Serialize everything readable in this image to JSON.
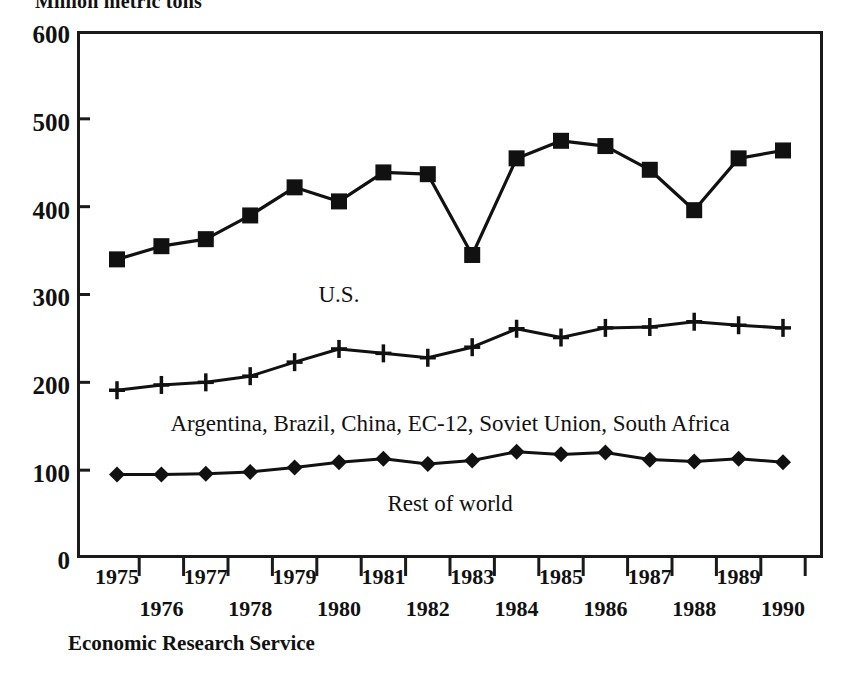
{
  "chart_data": {
    "type": "line",
    "title": "Million metric tons",
    "ylabel": "Million metric tons",
    "xlabel": "",
    "ylim": [
      0,
      600
    ],
    "yticks": [
      0,
      100,
      200,
      300,
      400,
      500,
      600
    ],
    "grid": false,
    "legend_position": "inline-annotations",
    "categories": [
      1975,
      1976,
      1977,
      1978,
      1979,
      1980,
      1981,
      1982,
      1983,
      1984,
      1985,
      1986,
      1987,
      1988,
      1989,
      1990
    ],
    "xtick_labels": [
      "1975",
      "1976",
      "1977",
      "1978",
      "1979",
      "1980",
      "1981",
      "1982",
      "1983",
      "1984",
      "1985",
      "1986",
      "1987",
      "1988",
      "1989",
      "1990"
    ],
    "series": [
      {
        "name": "U.S.",
        "marker": "square",
        "values": [
          340,
          355,
          363,
          390,
          422,
          406,
          439,
          437,
          345,
          455,
          475,
          469,
          442,
          396,
          455,
          464
        ]
      },
      {
        "name": "Argentina, Brazil, China, EC-12, Soviet Union, South Africa",
        "marker": "plus",
        "values": [
          191,
          197,
          200,
          207,
          223,
          238,
          233,
          228,
          240,
          261,
          251,
          262,
          263,
          269,
          265,
          262
        ]
      },
      {
        "name": "Rest of world",
        "marker": "diamond",
        "values": [
          95,
          95,
          96,
          98,
          103,
          109,
          113,
          107,
          111,
          121,
          118,
          120,
          112,
          110,
          113,
          109
        ]
      }
    ],
    "annotations": [
      {
        "text": "U.S.",
        "x_value": 1980,
        "y_value": 300
      },
      {
        "text": "Argentina, Brazil, China, EC-12, Soviet Union, South Africa",
        "x_value": 1982.5,
        "y_value": 152
      },
      {
        "text": "Rest of world",
        "x_value": 1982.5,
        "y_value": 62
      }
    ],
    "source": "Economic Research Service"
  },
  "axis": {
    "y_tick_0": "0",
    "y_tick_100": "100",
    "y_tick_200": "200",
    "y_tick_300": "300",
    "y_tick_400": "400",
    "y_tick_500": "500",
    "y_tick_600": "600"
  },
  "labels": {
    "us": "U.S.",
    "group": "Argentina, Brazil, China, EC-12, Soviet Union, South Africa",
    "rest": "Rest of world",
    "source": "Economic Research Service",
    "unit_title": "Million metric tons"
  }
}
